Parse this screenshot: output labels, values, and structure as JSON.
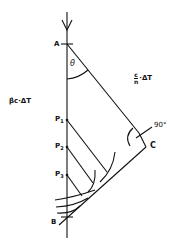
{
  "diagram": {
    "labels": {
      "point_a": "A",
      "point_b": "B",
      "point_c": "C",
      "p1": "P",
      "p1_sub": "1",
      "p2": "P",
      "p2_sub": "2",
      "p3": "P",
      "p3_sub": "3",
      "theta": "θ",
      "particle_path": "βc·ΔT",
      "light_path_num": "c",
      "light_path_den": "n",
      "light_path_rest": "·ΔT",
      "right_angle": "90°"
    },
    "colors": {
      "line": "#111111",
      "background": "#ffffff"
    }
  }
}
